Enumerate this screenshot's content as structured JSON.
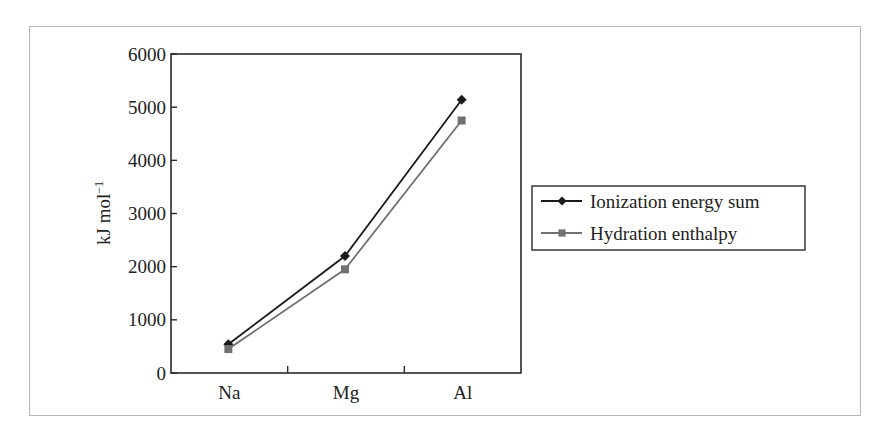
{
  "chart_data": {
    "type": "line",
    "title": "",
    "xlabel": "",
    "ylabel": "kJ mol⁻¹",
    "ylabel_base": "kJ mol",
    "ylabel_sup": "−1",
    "categories": [
      "Na",
      "Mg",
      "Al"
    ],
    "ylim": [
      0,
      6000
    ],
    "yticks": [
      0,
      1000,
      2000,
      3000,
      4000,
      5000,
      6000
    ],
    "grid": false,
    "legend_position": "right",
    "series": [
      {
        "name": "Ionization energy sum",
        "marker": "diamond",
        "color": "#1a1a1a",
        "values": [
          540,
          2200,
          5140
        ]
      },
      {
        "name": "Hydration enthalpy",
        "marker": "square",
        "color": "#707070",
        "values": [
          450,
          1950,
          4750
        ]
      }
    ]
  }
}
